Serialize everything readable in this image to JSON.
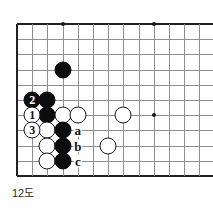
{
  "diagram": {
    "type": "go-board-problem",
    "caption": "12도",
    "board": {
      "cols": 13,
      "rows": 11,
      "origin_x": 17,
      "origin_y": 24,
      "spacing": 15.2,
      "top_edge": true,
      "left_edge": true,
      "bottom_edge_row": 10,
      "star_points": [
        {
          "col": 3,
          "row": 0
        },
        {
          "col": 9,
          "row": 0
        },
        {
          "col": 9,
          "row": 6
        }
      ]
    },
    "stones": [
      {
        "color": "black",
        "col": 3,
        "row": 3,
        "label": ""
      },
      {
        "color": "black",
        "col": 1,
        "row": 5,
        "label": "2",
        "move": 2
      },
      {
        "color": "black",
        "col": 2,
        "row": 5,
        "label": ""
      },
      {
        "color": "white",
        "col": 1,
        "row": 6,
        "label": "1",
        "move": 1
      },
      {
        "color": "black",
        "col": 2,
        "row": 6,
        "label": ""
      },
      {
        "color": "white",
        "col": 3,
        "row": 6,
        "label": ""
      },
      {
        "color": "white",
        "col": 4,
        "row": 6,
        "label": ""
      },
      {
        "color": "white",
        "col": 7,
        "row": 6,
        "label": ""
      },
      {
        "color": "white",
        "col": 1,
        "row": 7,
        "label": "3",
        "move": 3
      },
      {
        "color": "white",
        "col": 2,
        "row": 7,
        "label": ""
      },
      {
        "color": "black",
        "col": 3,
        "row": 7,
        "label": ""
      },
      {
        "color": "white",
        "col": 2,
        "row": 8,
        "label": ""
      },
      {
        "color": "black",
        "col": 3,
        "row": 8,
        "label": ""
      },
      {
        "color": "white",
        "col": 6,
        "row": 8,
        "label": ""
      },
      {
        "color": "white",
        "col": 2,
        "row": 9,
        "label": ""
      },
      {
        "color": "black",
        "col": 3,
        "row": 9,
        "label": ""
      }
    ],
    "point_labels": [
      {
        "text": "a",
        "col": 4,
        "row": 7
      },
      {
        "text": "b",
        "col": 4,
        "row": 8
      },
      {
        "text": "c",
        "col": 4,
        "row": 9
      }
    ],
    "colors": {
      "line": "#8f8f8f",
      "edge": "#222222",
      "black_stone": "#0d0d0d",
      "white_stone": "#ffffff",
      "background": "#fefefe"
    }
  }
}
